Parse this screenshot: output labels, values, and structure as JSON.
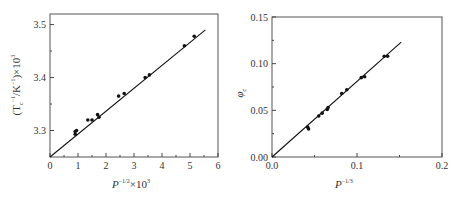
{
  "chart_data": [
    {
      "type": "scatter",
      "title": "",
      "xlabel": "P^{-1/2}×10^3",
      "ylabel": "(T_c^{-1}/K^{-1})×10^3",
      "xlim": [
        0,
        6
      ],
      "ylim": [
        3.25,
        3.52
      ],
      "xticks": [
        "0",
        "1",
        "2",
        "3",
        "4",
        "5",
        "6"
      ],
      "yticks": [
        "3.3",
        "3.4",
        "3.5"
      ],
      "grid": false,
      "legend": null,
      "fit_line": {
        "x": [
          0,
          5.55
        ],
        "y": [
          3.25,
          3.49
        ]
      },
      "series": [
        {
          "name": "data",
          "x": [
            0.9,
            0.9,
            0.95,
            1.35,
            1.5,
            1.7,
            1.75,
            2.45,
            2.65,
            3.4,
            3.55,
            4.8,
            5.15
          ],
          "y": [
            3.293,
            3.298,
            3.3,
            3.32,
            3.32,
            3.33,
            3.325,
            3.365,
            3.37,
            3.4,
            3.405,
            3.46,
            3.478
          ]
        }
      ]
    },
    {
      "type": "scatter",
      "title": "",
      "xlabel": "P^{-1/3}",
      "ylabel": "φ_c",
      "xlim": [
        0.0,
        0.2
      ],
      "ylim": [
        0.0,
        0.15
      ],
      "xticks": [
        "0.0",
        "0.1",
        "0.2"
      ],
      "yticks": [
        "0.00",
        "0.05",
        "0.10",
        "0.15"
      ],
      "grid": false,
      "legend": null,
      "fit_line": {
        "x": [
          0,
          0.152
        ],
        "y": [
          0,
          0.123
        ]
      },
      "series": [
        {
          "name": "data",
          "x": [
            0.042,
            0.043,
            0.055,
            0.059,
            0.065,
            0.066,
            0.082,
            0.088,
            0.105,
            0.109,
            0.132,
            0.136
          ],
          "y": [
            0.032,
            0.03,
            0.044,
            0.047,
            0.051,
            0.053,
            0.068,
            0.072,
            0.085,
            0.086,
            0.108,
            0.108
          ]
        }
      ]
    }
  ],
  "left": {
    "ytick_labels": [
      "3.3",
      "3.4",
      "3.5"
    ],
    "xtick_labels": [
      "0",
      "1",
      "2",
      "3",
      "4",
      "5",
      "6"
    ],
    "xlabel_base": "P",
    "xlabel_exp": "−1/2",
    "xlabel_tail": "×10",
    "xlabel_tail_exp": "3",
    "ylabel_text": "(T",
    "ylabel_sub": "c",
    "ylabel_exp1": "−1",
    "ylabel_mid": "/K",
    "ylabel_exp2": "−1",
    "ylabel_tail": ")×10",
    "ylabel_exp3": "3"
  },
  "right": {
    "ytick_labels": [
      "0.00",
      "0.05",
      "0.10",
      "0.15"
    ],
    "xtick_labels": [
      "0.0",
      "0.1",
      "0.2"
    ],
    "xlabel_base": "P",
    "xlabel_exp": "−1/3",
    "ylabel_base": "φ",
    "ylabel_sub": "c"
  }
}
